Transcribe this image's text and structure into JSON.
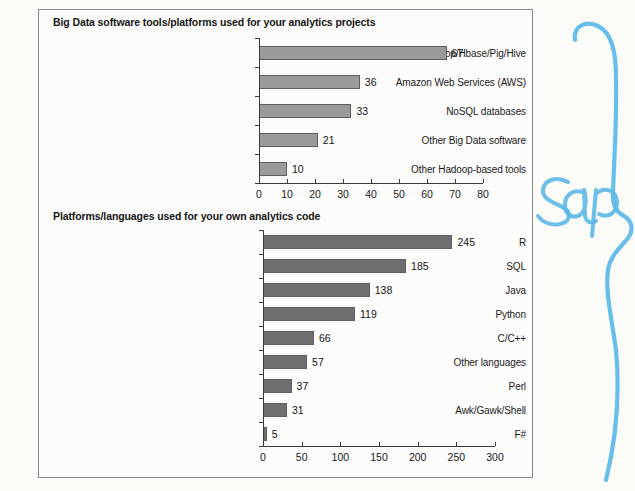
{
  "document": {
    "type": "scanned-page",
    "background_color": "#fbfbf8",
    "frame_border_color": "#8a8a8a"
  },
  "annotation": {
    "name": "handwritten-blue-ink",
    "text": "Sap",
    "color": "#5bb8e8",
    "description": "light blue handwritten scrawl with long vertical curved stroke"
  },
  "chart_data": [
    {
      "type": "bar",
      "orientation": "horizontal",
      "title": "Big Data software tools/platforms used for your analytics projects",
      "categories": [
        "Apache Hadoop/Hbase/Pig/Hive",
        "Amazon Web Services (AWS)",
        "NoSQL databases",
        "Other Big Data software",
        "Other Hadoop-based tools"
      ],
      "values": [
        67,
        36,
        33,
        21,
        10
      ],
      "labels": [
        "67",
        "36",
        "33",
        "21",
        "10"
      ],
      "xlabel": "",
      "ylabel": "",
      "xlim": [
        0,
        80
      ],
      "xticks": [
        0,
        10,
        20,
        30,
        40,
        50,
        60,
        70,
        80
      ],
      "xtick_labels": [
        "0",
        "10",
        "20",
        "30",
        "40",
        "50",
        "60",
        "70",
        "80"
      ],
      "grid": false,
      "legend": false,
      "bar_color": "#9a9a9a",
      "bar_edge_color": "#5d5d5d"
    },
    {
      "type": "bar",
      "orientation": "horizontal",
      "title": "Platforms/languages used for your own analytics code",
      "categories": [
        "R",
        "SQL",
        "Java",
        "Python",
        "C/C++",
        "Other languages",
        "Perl",
        "Awk/Gawk/Shell",
        "F#"
      ],
      "values": [
        245,
        185,
        138,
        119,
        66,
        57,
        37,
        31,
        5
      ],
      "labels": [
        "245",
        "185",
        "138",
        "119",
        "66",
        "57",
        "37",
        "31",
        "5"
      ],
      "xlabel": "",
      "ylabel": "",
      "xlim": [
        0,
        300
      ],
      "xticks": [
        0,
        50,
        100,
        150,
        200,
        250,
        300
      ],
      "xtick_labels": [
        "0",
        "50",
        "100",
        "150",
        "200",
        "250",
        "300"
      ],
      "grid": false,
      "legend": false,
      "bar_color": "#6e6e6e",
      "bar_edge_color": "#5d5d5d"
    }
  ]
}
